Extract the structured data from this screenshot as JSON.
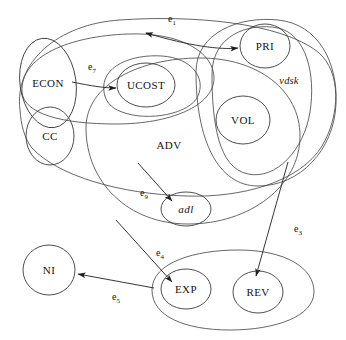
{
  "figure": {
    "type": "venn-euler-hypergraph-diagram",
    "background": "#ffffff",
    "stroke_color": "#3a3a3a",
    "width": 346,
    "height": 340
  },
  "nodes": [
    {
      "id": "ECON",
      "label": "ECON",
      "style": "upright",
      "cx": 48,
      "cy": 83,
      "rx": 28,
      "ry": 45,
      "rot": -8
    },
    {
      "id": "CC",
      "label": "CC",
      "style": "upright",
      "cx": 50,
      "cy": 136,
      "rx": 24,
      "ry": 29,
      "rot": 0
    },
    {
      "id": "UCOST",
      "label": "UCOST",
      "style": "upright",
      "cx": 146,
      "cy": 85,
      "rx": 29,
      "ry": 22,
      "rot": 0
    },
    {
      "id": "PRI",
      "label": "PRI",
      "style": "upright",
      "cx": 265,
      "cy": 46,
      "rx": 25,
      "ry": 22,
      "rot": 0
    },
    {
      "id": "VOL",
      "label": "VOL",
      "style": "upright",
      "cx": 243,
      "cy": 120,
      "rx": 27,
      "ry": 24,
      "rot": 0
    },
    {
      "id": "adl",
      "label": "adl",
      "style": "italic",
      "cx": 186,
      "cy": 209,
      "rx": 25,
      "ry": 17,
      "rot": 0
    },
    {
      "id": "NI",
      "label": "NI",
      "style": "upright",
      "cx": 49,
      "cy": 270,
      "rx": 26,
      "ry": 25,
      "rot": 0
    },
    {
      "id": "EXP",
      "label": "EXP",
      "style": "upright",
      "cx": 186,
      "cy": 289,
      "rx": 25,
      "ry": 20,
      "rot": 0
    },
    {
      "id": "REV",
      "label": "REV",
      "style": "upright",
      "cx": 258,
      "cy": 292,
      "rx": 25,
      "ry": 21,
      "rot": 0
    }
  ],
  "regions": [
    {
      "id": "outer",
      "label": "",
      "label_x": 0,
      "label_y": 0
    },
    {
      "id": "ADV",
      "label": "ADV",
      "label_x": 169,
      "label_y": 145
    },
    {
      "id": "vdsk",
      "label": "vdsk",
      "label_x": 289,
      "label_y": 80,
      "italic": true
    }
  ],
  "edges": [
    {
      "id": "e1",
      "label": "e",
      "sub": "1",
      "label_x": 171,
      "label_y": 19,
      "from": "outer-left-boundary",
      "to": "PRI",
      "arrowheads": 2
    },
    {
      "id": "e7",
      "label": "e",
      "sub": "7",
      "label_x": 90,
      "label_y": 68,
      "from": "ECON",
      "to": "UCOST",
      "arrowheads": 1
    },
    {
      "id": "e9",
      "label": "e",
      "sub": "9",
      "label_x": 142,
      "label_y": 193,
      "from": "ADV-boundary",
      "to": "adl",
      "arrowheads": 1
    },
    {
      "id": "e4",
      "label": "e",
      "sub": "4",
      "label_x": 159,
      "label_y": 252,
      "from": "ADV-boundary",
      "to": "EXP",
      "arrowheads": 1
    },
    {
      "id": "e3",
      "label": "e",
      "sub": "3",
      "label_x": 296,
      "label_y": 228,
      "from": "vdsk-boundary",
      "to": "REV",
      "arrowheads": 1
    },
    {
      "id": "e5",
      "label": "e",
      "sub": "5",
      "label_x": 116,
      "label_y": 297,
      "from": "EXP",
      "to": "NI",
      "arrowheads": 1
    }
  ]
}
